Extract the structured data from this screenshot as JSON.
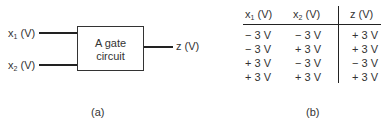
{
  "diagram": {
    "inputs": [
      {
        "name": "x",
        "sub": "1",
        "unit": " (V)"
      },
      {
        "name": "x",
        "sub": "2",
        "unit": " (V)"
      }
    ],
    "block_label_line1": "A gate",
    "block_label_line2": "circuit",
    "output": "z (V)",
    "caption": "(a)"
  },
  "table": {
    "headers": [
      {
        "name": "x",
        "sub": "1",
        "unit": " (V)"
      },
      {
        "name": "x",
        "sub": "2",
        "unit": " (V)"
      },
      {
        "name": "z",
        "sub": "",
        "unit": " (V)"
      }
    ],
    "rows": [
      [
        "− 3 V",
        "− 3 V",
        "+ 3 V"
      ],
      [
        "− 3 V",
        "+ 3 V",
        "+ 3 V"
      ],
      [
        "+ 3 V",
        "− 3 V",
        "− 3 V"
      ],
      [
        "+ 3 V",
        "+ 3 V",
        "+ 3 V"
      ]
    ],
    "caption": "(b)"
  }
}
